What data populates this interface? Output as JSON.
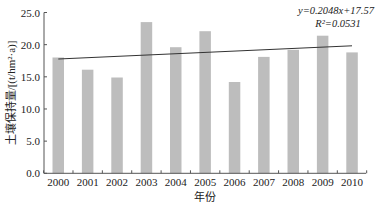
{
  "chart_data": {
    "type": "bar",
    "title": "",
    "xlabel": "年份",
    "ylabel": "土壤保持量/[(t/hm²·a)]",
    "categories": [
      "2000",
      "2001",
      "2002",
      "2003",
      "2004",
      "2005",
      "2006",
      "2007",
      "2008",
      "2009",
      "2010"
    ],
    "values": [
      18.0,
      16.1,
      14.9,
      23.5,
      19.6,
      22.1,
      14.2,
      18.1,
      19.2,
      21.4,
      18.8
    ],
    "ylim": [
      0,
      25
    ],
    "yticks": [
      "0.0",
      "5.0",
      "10.0",
      "15.0",
      "20.0",
      "25.0"
    ],
    "ytick_values": [
      0,
      5,
      10,
      15,
      20,
      25
    ],
    "grid": false,
    "legend": null,
    "trendline": {
      "type": "linear",
      "slope": 0.2048,
      "intercept": 17.57,
      "equation": "y=0.2048x+17.57",
      "r_squared": "R²=0.0531"
    },
    "bar_color": "#bdbdbd",
    "line_color": "#333333"
  }
}
